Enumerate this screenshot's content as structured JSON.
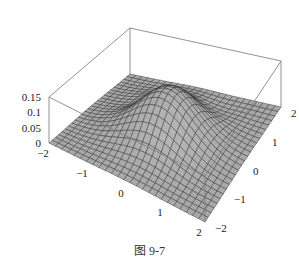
{
  "chart_data": {
    "type": "surface3d",
    "title": "",
    "caption": "图 9-7",
    "x_range": [
      -2,
      2
    ],
    "y_range": [
      -2,
      2
    ],
    "z_range": [
      0,
      0.15
    ],
    "x_ticks": [
      "-2",
      "-1",
      "0",
      "1",
      "2"
    ],
    "y_ticks": [
      "-2",
      "-1",
      "0",
      "1",
      "2"
    ],
    "z_ticks": [
      "0",
      "0.05",
      "0.1",
      "0.15"
    ],
    "surface": {
      "description": "Single smooth bump peaking near the center at about z = 0.15, flattening to z ≈ 0 at the edges; shallow dips on either side of the peak",
      "peak": {
        "x": 0,
        "y": 0,
        "z": 0.15
      },
      "grid_lines": 25,
      "face_color": "#a8a8a8",
      "mesh_color": "#2a2a2a"
    },
    "box": true,
    "grid": false,
    "legend": null
  }
}
